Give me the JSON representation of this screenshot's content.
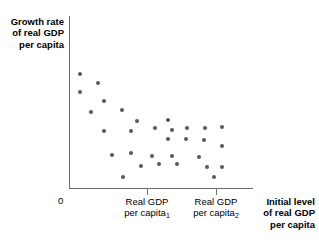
{
  "chart_data": {
    "type": "scatter",
    "title": "",
    "ylabel": "Growth rate\nof real GDP\nper capita",
    "xlabel": "Initial level\nof real GDP\nper capita",
    "origin_label": "0",
    "grid": false,
    "legend": null,
    "xlim": [
      0,
      1
    ],
    "ylim": [
      0,
      1
    ],
    "x_tick_labels": [
      {
        "line1": "Real GDP",
        "line2": "per capita",
        "subscript": "1",
        "x_px": 147
      },
      {
        "line1": "Real GDP",
        "line2": "per capita",
        "subscript": "2",
        "x_px": 216
      }
    ],
    "point_color": "#58595b",
    "axis_color": "#6d6e70",
    "points": [
      {
        "x": 80,
        "y": 74
      },
      {
        "x": 98,
        "y": 83
      },
      {
        "x": 80,
        "y": 92
      },
      {
        "x": 104,
        "y": 101
      },
      {
        "x": 91,
        "y": 112
      },
      {
        "x": 122,
        "y": 110
      },
      {
        "x": 104,
        "y": 131
      },
      {
        "x": 131,
        "y": 131
      },
      {
        "x": 137,
        "y": 121
      },
      {
        "x": 155,
        "y": 128
      },
      {
        "x": 168,
        "y": 120
      },
      {
        "x": 172,
        "y": 130
      },
      {
        "x": 187,
        "y": 128
      },
      {
        "x": 205,
        "y": 128
      },
      {
        "x": 222,
        "y": 127
      },
      {
        "x": 168,
        "y": 139
      },
      {
        "x": 186,
        "y": 139
      },
      {
        "x": 204,
        "y": 140
      },
      {
        "x": 222,
        "y": 146
      },
      {
        "x": 112,
        "y": 155
      },
      {
        "x": 131,
        "y": 153
      },
      {
        "x": 152,
        "y": 156
      },
      {
        "x": 172,
        "y": 156
      },
      {
        "x": 199,
        "y": 157
      },
      {
        "x": 141,
        "y": 166
      },
      {
        "x": 159,
        "y": 164
      },
      {
        "x": 177,
        "y": 164
      },
      {
        "x": 207,
        "y": 167
      },
      {
        "x": 222,
        "y": 167
      },
      {
        "x": 123,
        "y": 177
      },
      {
        "x": 214,
        "y": 177
      }
    ]
  }
}
